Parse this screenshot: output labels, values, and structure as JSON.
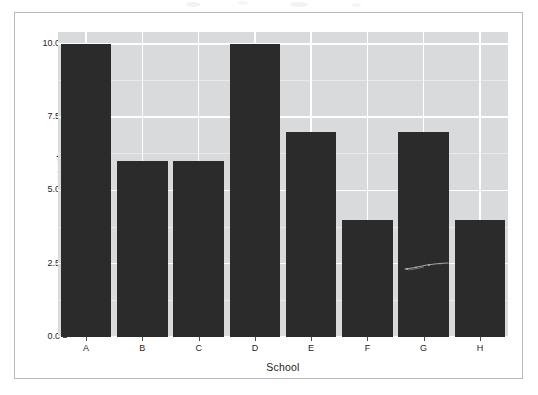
{
  "chart_data": {
    "type": "bar",
    "title": "",
    "subtitle": "",
    "categories": [
      "A",
      "B",
      "C",
      "D",
      "E",
      "F",
      "G",
      "H"
    ],
    "values": [
      10,
      6,
      6,
      10,
      7,
      4,
      7,
      4
    ],
    "series": [
      {
        "name": "count",
        "values": [
          10,
          6,
          6,
          10,
          7,
          4,
          7,
          4
        ]
      }
    ],
    "xlabel": "School",
    "ylabel": "count",
    "ylim": [
      0,
      10.4
    ],
    "y_ticks": [
      "0.0",
      "2.5",
      "5.0",
      "7.5",
      "10.0"
    ],
    "y_tick_values": [
      0,
      2.5,
      5,
      7.5,
      10
    ],
    "y_minor_tick_values": [
      1.25,
      3.75,
      6.25,
      8.75
    ],
    "x_ticks": [
      "A",
      "B",
      "C",
      "D",
      "E",
      "F",
      "G",
      "H"
    ],
    "grid": true,
    "legend": "none",
    "legend_position": "none",
    "annotations": []
  },
  "style": {
    "panel_background": "#d9dadb",
    "grid_major_color": "#ffffff",
    "grid_minor_color": "#eaeaeb",
    "bar_fill": "#2b2b2b",
    "axis_text_color": "#242424",
    "axis_title_color": "#1a1a1a",
    "page_border_color": "#b9babd",
    "page_background": "#ffffff"
  },
  "artifacts": {
    "scratch_on_bar": "G",
    "scratch_label": "scan-scratch-artifact"
  }
}
